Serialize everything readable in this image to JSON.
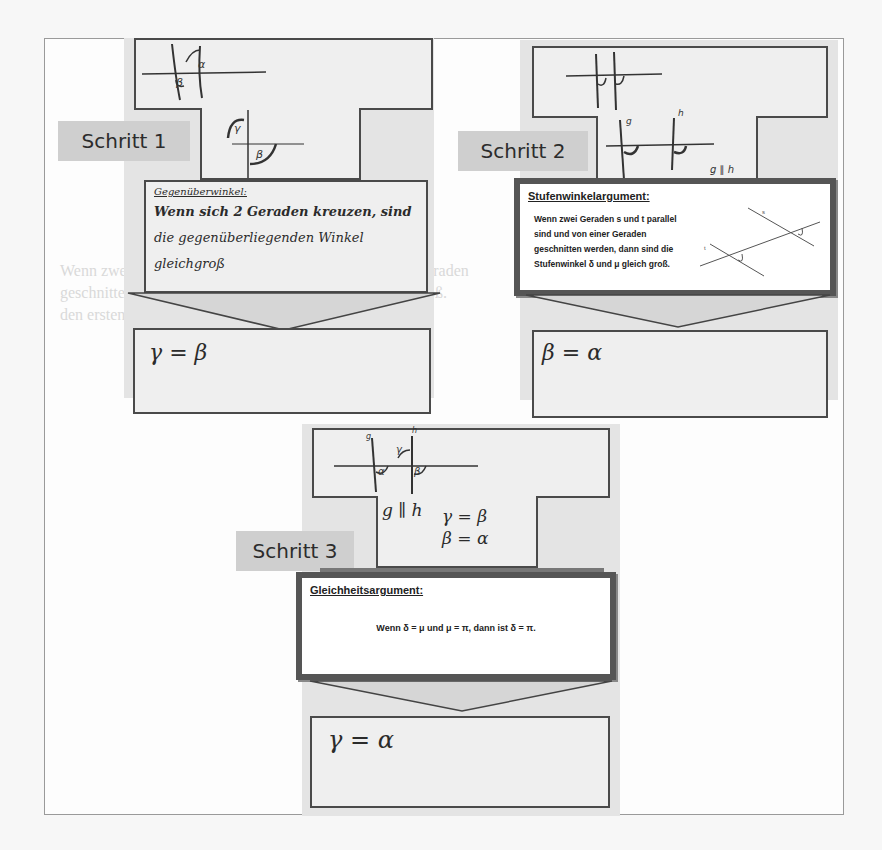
{
  "steps": [
    {
      "label": "Schritt 1",
      "conclusion_box": {
        "title": "Gegenüberwinkel:",
        "lines": [
          "Wenn sich 2 Geraden kreuzen, sind",
          "die gegenüberliegenden Winkel",
          "gleichgroß"
        ]
      },
      "result": "γ = β",
      "angle_marks": [
        "β",
        "α",
        "γ",
        "β"
      ]
    },
    {
      "label": "Schritt 2",
      "annotation": "g ∥ h",
      "line_labels": [
        "g",
        "h"
      ],
      "argument": {
        "title": "Stufenwinkelargument:",
        "lines": [
          "Wenn zwei Geraden s und t parallel",
          "sind und von einer Geraden",
          "geschnitten werden, dann sind die",
          "Stufenwinkel δ und μ gleich groß."
        ],
        "figure_labels": [
          "s",
          "t",
          "δ",
          "μ"
        ]
      },
      "result": "β = α"
    },
    {
      "label": "Schritt 3",
      "premises": [
        "g ∥ h",
        "γ = β",
        "β = α"
      ],
      "line_labels": [
        "g",
        "h"
      ],
      "angle_marks": [
        "γ",
        "α",
        "β"
      ],
      "argument": {
        "title": "Gleichheitsargument:",
        "text": "Wenn δ = μ und μ = π, dann ist δ = π."
      },
      "result": "γ = α"
    }
  ],
  "background_text": [
    "Wenn zwei Geraden s und t parallel sind und von einer Geraden",
    "geschnitten werden, dann sind die Stufenwinkel gleich groß.",
    "den ersten gemeinsamen Schritt von oben anzufangen"
  ],
  "colors": {
    "column_bg": "#e4e4e4",
    "label_bg": "#cfcfcf",
    "box_border": "#4a4a4a",
    "argument_border": "#555555"
  }
}
